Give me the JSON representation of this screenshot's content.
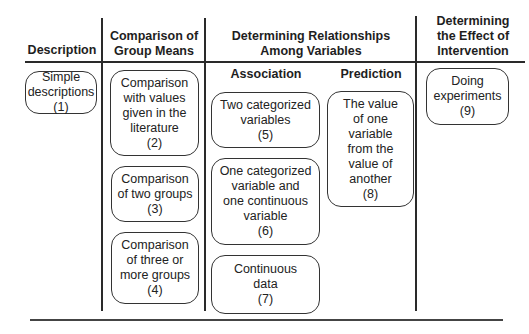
{
  "columns": [
    {
      "id": "description",
      "header": [
        "Description"
      ]
    },
    {
      "id": "group-means",
      "header": [
        "Comparison of",
        "Group Means"
      ]
    },
    {
      "id": "relationships",
      "header": [
        "Determining Relationships",
        "Among Variables"
      ],
      "subheaders": [
        "Association",
        "Prediction"
      ]
    },
    {
      "id": "intervention",
      "header": [
        "Determining",
        "the Effect of",
        "Intervention"
      ]
    }
  ],
  "boxes": {
    "b1": [
      "Simple",
      "descriptions",
      "(1)"
    ],
    "b2": [
      "Comparison",
      "with values",
      "given in the",
      "literature",
      "(2)"
    ],
    "b3": [
      "Comparison",
      "of two groups",
      "(3)"
    ],
    "b4": [
      "Comparison",
      "of three or",
      "more groups",
      "(4)"
    ],
    "b5": [
      "Two categorized",
      "variables",
      "(5)"
    ],
    "b6": [
      "One categorized",
      "variable and",
      "one continuous",
      "variable",
      "(6)"
    ],
    "b7": [
      "Continuous",
      "data",
      "(7)"
    ],
    "b8": [
      "The value",
      "of one",
      "variable",
      "from the",
      "value of",
      "another",
      "(8)"
    ],
    "b9": [
      "Doing",
      "experiments",
      "(9)"
    ]
  }
}
